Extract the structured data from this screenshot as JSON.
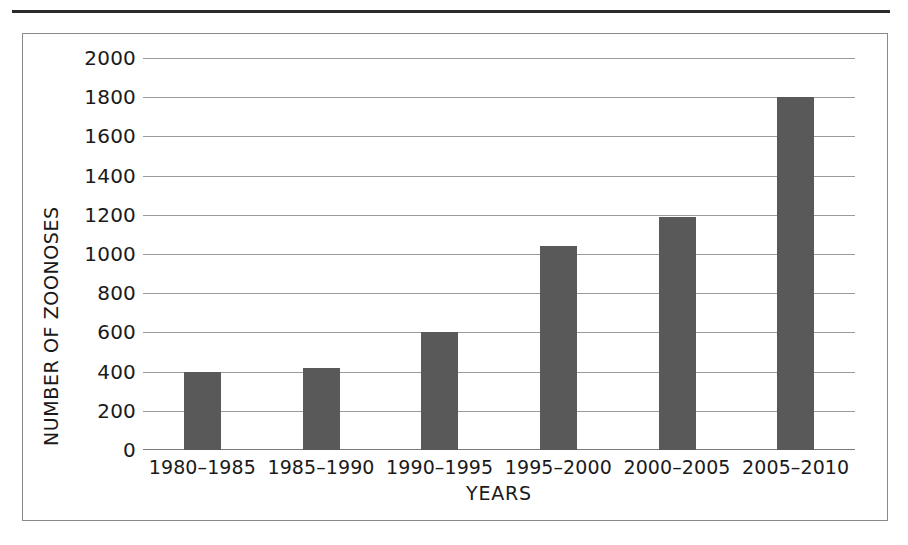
{
  "figure": {
    "has_top_rule": true,
    "frame_color": "#8a8a8a",
    "background": "#ffffff"
  },
  "chart_data": {
    "type": "bar",
    "title": "",
    "subtitle": "",
    "xlabel": "YEARS",
    "ylabel": "NUMBER OF ZOONOSES",
    "categories": [
      "1980–1985",
      "1985–1990",
      "1990–1995",
      "1995–2000",
      "2000–2005",
      "2005–2010"
    ],
    "values": [
      400,
      420,
      600,
      1040,
      1190,
      1800
    ],
    "ylim": [
      0,
      2000
    ],
    "ytick_step": 200,
    "yticks": [
      2000,
      1800,
      1600,
      1400,
      1200,
      1000,
      800,
      600,
      400,
      200,
      0
    ],
    "ytick_labels": [
      "2000",
      "1800",
      "1600",
      "1400",
      "1200",
      "1000",
      "800",
      "600",
      "400",
      "200",
      "0"
    ],
    "grid": true,
    "grid_axis": "y",
    "grid_color": "#9b9b9b",
    "bar_color": "#595959",
    "legend": null,
    "legend_position": "none",
    "annotations": []
  }
}
